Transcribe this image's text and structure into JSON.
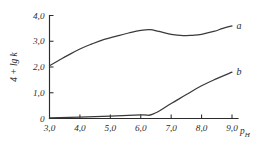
{
  "chart_data": {
    "type": "line",
    "title": "",
    "subtitle": "",
    "xlabel": "pH",
    "xlabel_main": "p",
    "xlabel_sub": "H",
    "ylabel": "4 + lg k",
    "xlim": [
      3.0,
      9.0
    ],
    "ylim": [
      0.0,
      4.0
    ],
    "grid": false,
    "legend_position": "inline-right-of-curve-ends",
    "decimal_separator": ",",
    "x_ticks": [
      3.0,
      4.0,
      5.0,
      6.0,
      7.0,
      8.0,
      9.0
    ],
    "x_tick_labels": [
      "3,0",
      "4,0",
      "5,0",
      "6,0",
      "7,0",
      "8,0",
      "9,0"
    ],
    "y_ticks": [
      0.0,
      1.0,
      2.0,
      3.0,
      4.0
    ],
    "y_tick_labels": [
      "0",
      "1,0",
      "2,0",
      "3,0",
      "4,0"
    ],
    "series": [
      {
        "name": "a",
        "label": "a",
        "color": "#3a3a3a",
        "x": [
          3.0,
          3.3,
          3.6,
          4.0,
          4.4,
          4.8,
          5.2,
          5.6,
          6.0,
          6.3,
          6.6,
          7.0,
          7.4,
          7.7,
          8.0,
          8.4,
          8.7,
          9.0
        ],
        "y": [
          2.05,
          2.25,
          2.45,
          2.7,
          2.9,
          3.07,
          3.2,
          3.32,
          3.42,
          3.45,
          3.38,
          3.27,
          3.22,
          3.23,
          3.27,
          3.38,
          3.5,
          3.6
        ]
      },
      {
        "name": "b",
        "label": "b",
        "color": "#3a3a3a",
        "x": [
          3.0,
          4.0,
          5.0,
          6.0,
          6.4,
          7.0,
          7.5,
          8.0,
          8.5,
          9.0
        ],
        "y": [
          0.02,
          0.05,
          0.09,
          0.14,
          0.17,
          0.58,
          0.93,
          1.27,
          1.55,
          1.8
        ]
      }
    ],
    "annotations": [
      {
        "name": "curve-a-endpoint-label",
        "text": "a",
        "x": 9.15,
        "y": 3.6
      },
      {
        "name": "curve-b-endpoint-label",
        "text": "b",
        "x": 9.15,
        "y": 1.82
      }
    ]
  }
}
